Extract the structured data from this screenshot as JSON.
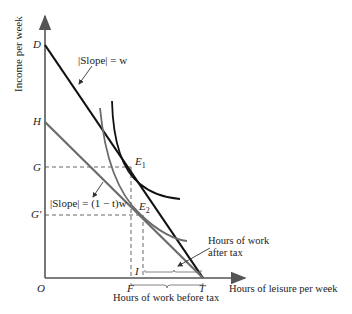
{
  "diagram": {
    "type": "labor-leisure budget constraint with income tax",
    "y_axis_label": "Income per week",
    "x_axis_label": "Hours of leisure per week",
    "origin_label": "O",
    "y_points": {
      "D": "D",
      "H": "H",
      "G": "G",
      "G_prime": "G'"
    },
    "x_points": {
      "F": "F",
      "I": "I",
      "T": "T"
    },
    "equilibria": {
      "E1": "E",
      "E1_sub": "1",
      "E2": "E",
      "E2_sub": "2"
    },
    "annotations": {
      "slope_pre_tax": "|Slope| = w",
      "slope_post_tax": "|Slope| = (1 − t)w",
      "work_after_tax_line1": "Hours of work",
      "work_after_tax_line2": "after tax",
      "work_before_tax": "Hours of work before tax"
    },
    "colors": {
      "pre_tax_line": "#111111",
      "post_tax_line": "#6b6b6b",
      "indifference_high": "#111111",
      "indifference_low": "#6b6b6b",
      "axes": "#555555",
      "dashed_guides": "#555555"
    }
  }
}
